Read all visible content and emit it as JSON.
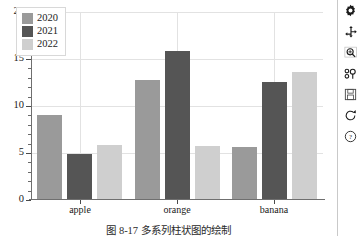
{
  "chart_data": {
    "type": "bar",
    "title": "",
    "subtitle": "",
    "xlabel": "",
    "ylabel": "",
    "categories": [
      "apple",
      "orange",
      "banana"
    ],
    "series": [
      {
        "name": "2020",
        "values": [
          9.0,
          12.8,
          5.6
        ],
        "color": "#9a9a9a"
      },
      {
        "name": "2021",
        "values": [
          4.9,
          15.8,
          12.6
        ],
        "color": "#555555"
      },
      {
        "name": "2022",
        "values": [
          5.9,
          5.7,
          13.6
        ],
        "color": "#cfcfcf"
      }
    ],
    "ylim": [
      0,
      20
    ],
    "yticks": [
      0,
      5,
      10,
      15,
      20
    ],
    "ytick_labels": [
      "0",
      "5",
      "10",
      "15",
      "20"
    ],
    "minor_ticks": true,
    "grid": true,
    "grid_color": "#e2e2e2",
    "legend_position": "upper left",
    "legend_entries": [
      "2020",
      "2021",
      "2022"
    ]
  },
  "caption": {
    "text": "图 8-17   多系列柱状图的绘制"
  },
  "toolbar": {
    "buttons": [
      {
        "name": "settings-icon",
        "label": "Settings"
      },
      {
        "name": "move-icon",
        "label": "Pan/Move"
      },
      {
        "name": "zoom-icon",
        "label": "Zoom"
      },
      {
        "name": "subplots-icon",
        "label": "Configure subplots"
      },
      {
        "name": "save-icon",
        "label": "Save figure"
      },
      {
        "name": "reset-icon",
        "label": "Reset view"
      },
      {
        "name": "help-icon",
        "label": "Help"
      }
    ]
  }
}
